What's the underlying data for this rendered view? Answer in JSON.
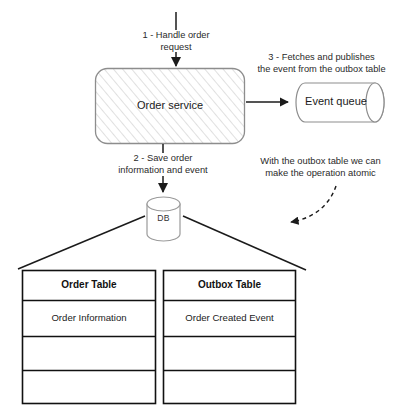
{
  "diagram": {
    "steps": [
      {
        "id": "step1",
        "text": "1 - Handle order\nrequest"
      },
      {
        "id": "step2",
        "text": "2 - Save order\ninformation and event"
      },
      {
        "id": "step3",
        "text": "3 - Fetches and publishes\nthe event from the outbox table"
      }
    ],
    "notes": [
      {
        "id": "note-atomic",
        "text": "With the outbox table we can\nmake the operation atomic"
      }
    ],
    "nodes": [
      {
        "id": "order-service",
        "label": "Order service",
        "shape": "rounded-rect-hatched"
      },
      {
        "id": "event-queue",
        "label": "Event queue",
        "shape": "horizontal-cylinder"
      },
      {
        "id": "database",
        "label": "DB",
        "shape": "vertical-cylinder"
      }
    ],
    "tables": [
      {
        "id": "order-table",
        "header": "Order Table",
        "rows": [
          "Order Information",
          "",
          ""
        ]
      },
      {
        "id": "outbox-table",
        "header": "Outbox Table",
        "rows": [
          "Order Created Event",
          "",
          ""
        ]
      }
    ],
    "colors": {
      "stroke": "#1b1b1b",
      "node_stroke": "#8a8a8a",
      "hatch": "#c9c9c9",
      "background": "#ffffff",
      "text": "#1b1b1b"
    }
  }
}
